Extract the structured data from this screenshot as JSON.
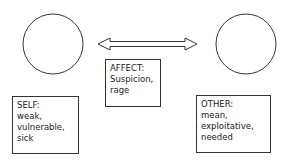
{
  "diagram": {
    "self": {
      "title": "SELF:",
      "lines": [
        "weak,",
        "vulnerable,",
        "sick"
      ]
    },
    "affect": {
      "title": "AFFECT:",
      "lines": [
        "Suspicion,",
        "rage"
      ]
    },
    "other": {
      "title": "OTHER:",
      "lines": [
        "mean,",
        "exploitative,",
        "needed"
      ]
    },
    "connector": "double-headed-arrow"
  },
  "colors": {
    "stroke": "#333333",
    "background": "#ffffff"
  }
}
